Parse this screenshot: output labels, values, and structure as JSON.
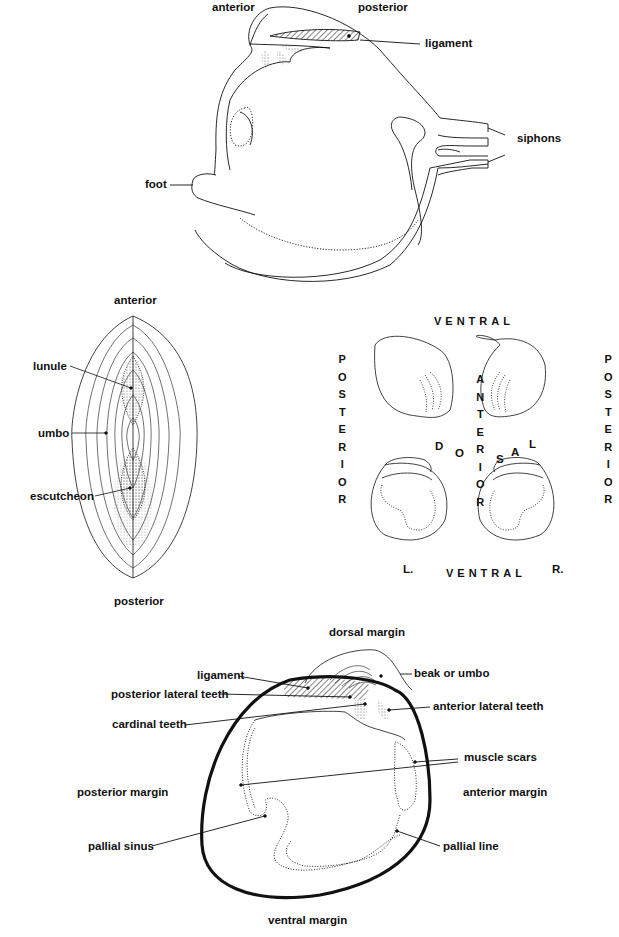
{
  "panel1": {
    "title": "Clam with foot and siphons extended (lateral view)",
    "labels": {
      "anterior": "anterior",
      "posterior": "posterior",
      "ligament": "ligament",
      "siphons": "siphons",
      "foot": "foot"
    }
  },
  "panel2": {
    "title": "Dorsal view of closed shell",
    "labels": {
      "anterior": "anterior",
      "lunule": "lunule",
      "umbo": "umbo",
      "escutcheon": "escutcheon",
      "posterior": "posterior"
    }
  },
  "panel3": {
    "title": "Orientation of left and right valves",
    "labels": {
      "ventral_top": "VENTRAL",
      "ventral_bottom": "VENTRAL",
      "posterior_left": [
        "P",
        "O",
        "S",
        "T",
        "E",
        "R",
        "I",
        "O",
        "R"
      ],
      "posterior_right": [
        "P",
        "O",
        "S",
        "T",
        "E",
        "R",
        "I",
        "O",
        "R"
      ],
      "anterior_center": [
        "A",
        "N",
        "T",
        "E",
        "R",
        "I",
        "O",
        "R"
      ],
      "dorsal": [
        "D",
        "O",
        "S",
        "A",
        "L"
      ],
      "left_valve": "L.",
      "right_valve": "R."
    }
  },
  "panel4": {
    "title": "Interior of right valve",
    "labels": {
      "dorsal_margin": "dorsal margin",
      "ligament": "ligament",
      "beak_or_umbo": "beak or umbo",
      "posterior_lateral_teeth": "posterior lateral teeth",
      "anterior_lateral_teeth": "anterior lateral teeth",
      "cardinal_teeth": "cardinal teeth",
      "muscle_scars": "muscle scars",
      "posterior_margin": "posterior margin",
      "anterior_margin": "anterior margin",
      "pallial_sinus": "pallial sinus",
      "pallial_line": "pallial line",
      "ventral_margin": "ventral margin"
    }
  },
  "colors": {
    "ink": "#111111",
    "background": "#ffffff",
    "stipple": "#666666"
  }
}
